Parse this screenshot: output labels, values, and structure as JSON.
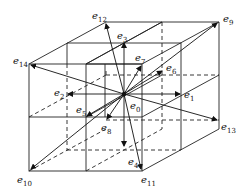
{
  "diagram": {
    "type": "D3Q15 lattice velocity set",
    "center": [
      124,
      95
    ],
    "labels": [
      {
        "id": "e0",
        "text": "e",
        "sub": "0",
        "x": 130,
        "y": 101
      },
      {
        "id": "e1",
        "text": "e",
        "sub": "1",
        "x": 184,
        "y": 90
      },
      {
        "id": "e2",
        "text": "e",
        "sub": "2",
        "x": 54,
        "y": 88
      },
      {
        "id": "e3",
        "text": "e",
        "sub": "3",
        "x": 117,
        "y": 31
      },
      {
        "id": "e4",
        "text": "e",
        "sub": "4",
        "x": 128,
        "y": 157
      },
      {
        "id": "e5",
        "text": "e",
        "sub": "5",
        "x": 76,
        "y": 105
      },
      {
        "id": "e6",
        "text": "e",
        "sub": "6",
        "x": 166,
        "y": 63
      },
      {
        "id": "e7",
        "text": "e",
        "sub": "7",
        "x": 135,
        "y": 53
      },
      {
        "id": "e8",
        "text": "e",
        "sub": "8",
        "x": 101,
        "y": 123
      },
      {
        "id": "e9",
        "text": "e",
        "sub": "9",
        "x": 223,
        "y": 14
      },
      {
        "id": "e10",
        "text": "e",
        "sub": "10",
        "x": 17,
        "y": 175
      },
      {
        "id": "e11",
        "text": "e",
        "sub": "11",
        "x": 141,
        "y": 175
      },
      {
        "id": "e12",
        "text": "e",
        "sub": "12",
        "x": 92,
        "y": 11
      },
      {
        "id": "e13",
        "text": "e",
        "sub": "13",
        "x": 221,
        "y": 122
      },
      {
        "id": "e14",
        "text": "e",
        "sub": "14",
        "x": 13,
        "y": 56
      }
    ]
  }
}
